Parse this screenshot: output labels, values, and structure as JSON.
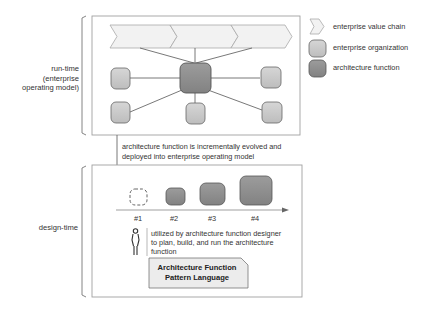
{
  "sections": {
    "runtime": {
      "label_lines": [
        "run-time",
        "(enterprise",
        "operating model)"
      ]
    },
    "designtime": {
      "label": "design-time"
    }
  },
  "legend": {
    "items": [
      {
        "icon": "chevron-icon",
        "label": "enterprise value chain"
      },
      {
        "icon": "light-rounded-box-icon",
        "label": "enterprise organization"
      },
      {
        "icon": "dark-rounded-box-icon",
        "label": "architecture function"
      }
    ]
  },
  "connector": {
    "text_lines": [
      "architecture function is incrementally evolved and",
      "deployed into enterprise operating model"
    ]
  },
  "evolution": {
    "steps": [
      "#1",
      "#2",
      "#3",
      "#4"
    ]
  },
  "designer": {
    "text_lines": [
      "utilized by architecture function designer",
      "to plan, build, and run the architecture",
      "function"
    ]
  },
  "pattern_language": {
    "title_lines": [
      "Architecture Function",
      "Pattern Language"
    ]
  },
  "colors": {
    "org_fill": "#c8c8c8",
    "arch_fill": "#8f8f8f",
    "chevron_fill": "#f0f0f0",
    "frame_stroke": "#9a9a9a",
    "pattern_fill": "#ececec"
  }
}
